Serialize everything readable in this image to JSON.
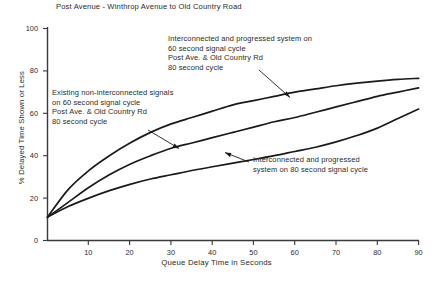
{
  "chart_data": {
    "type": "line",
    "title": "Post Avenue - Winthrop Avenue to Old Country Road",
    "xlabel": "Queue Delay Time in Seconds",
    "ylabel": "% Delayed Time Shown or Less",
    "xlim": [
      0,
      90
    ],
    "ylim": [
      0,
      100
    ],
    "xticks": [
      10,
      20,
      30,
      40,
      50,
      60,
      70,
      80,
      90
    ],
    "yticks": [
      0,
      20,
      40,
      60,
      80,
      100
    ],
    "grid": false,
    "legend": "annotations-with-leader-lines",
    "series": [
      {
        "name": "Interconnected and progressed system on 60 second signal cycle, Post Ave. & Old Country Rd 80 second cycle",
        "x": [
          0,
          5,
          10,
          15,
          20,
          25,
          30,
          35,
          40,
          45,
          50,
          55,
          60,
          65,
          70,
          75,
          80,
          85,
          90
        ],
        "values": [
          11,
          24,
          33,
          40,
          46,
          51,
          55,
          58,
          61,
          64,
          66,
          68,
          70,
          71.5,
          73,
          74.2,
          75.2,
          76,
          76.5
        ]
      },
      {
        "name": "Existing non-interconnected signals on 60 second signal cycle, Post Ave. & Old Country Rd 80 second cycle",
        "x": [
          0,
          5,
          10,
          15,
          20,
          25,
          30,
          35,
          40,
          45,
          50,
          55,
          60,
          65,
          70,
          75,
          80,
          85,
          90
        ],
        "values": [
          11,
          18,
          25,
          31,
          36,
          40,
          43.5,
          46,
          48.5,
          51,
          53.5,
          56,
          58,
          60.5,
          63,
          65.5,
          68,
          70,
          72
        ]
      },
      {
        "name": "Interconnected and progressed system on 80 second signal cycle",
        "x": [
          0,
          5,
          10,
          15,
          20,
          25,
          30,
          35,
          40,
          45,
          50,
          55,
          60,
          65,
          70,
          75,
          80,
          85,
          90
        ],
        "values": [
          11,
          16,
          20,
          23.5,
          26.5,
          29,
          31,
          33,
          34.8,
          36.5,
          38.2,
          40,
          42,
          44,
          46.5,
          49.5,
          53,
          57.5,
          62
        ]
      }
    ],
    "annotations": [
      {
        "id": "interconnected-60",
        "lines": [
          "Interconnected and progressed system on",
          "60 second signal cycle",
          "Post Ave.  & Old Country Rd",
          "80 second cycle"
        ]
      },
      {
        "id": "existing-noninterconnected",
        "lines": [
          "Existing non-interconnected signals",
          "on 60 second signal cycle",
          "Post Ave.  & Old Country Rd",
          "80 second cycle"
        ]
      },
      {
        "id": "interconnected-80",
        "lines": [
          "Interconnected and progressed",
          "system on 80 second signal cycle"
        ]
      }
    ]
  },
  "axis": {
    "x_tick_labels": [
      "10",
      "20",
      "30",
      "40",
      "50",
      "60",
      "70",
      "80",
      "90"
    ],
    "y_tick_labels": [
      "0",
      "20",
      "40",
      "60",
      "80",
      "100"
    ],
    "x_title": "Queue Delay Time in Seconds",
    "y_title": "% Delayed Time Shown or Less"
  },
  "figure": {
    "title": "Post Avenue - Winthrop Avenue to Old Country Road",
    "line_color": "#1a1a1a",
    "axis_color": "#3a3a3a",
    "background": "#ffffff"
  },
  "annotation_text": {
    "a1_l1": "Interconnected and progressed system on",
    "a1_l2": "60 second signal cycle",
    "a1_l3": "Post Ave.  & Old Country Rd",
    "a1_l4": "80 second cycle",
    "a2_l1": "Existing non-interconnected signals",
    "a2_l2": "on 60 second signal cycle",
    "a2_l3": "Post Ave.  & Old Country Rd",
    "a2_l4": "80 second cycle",
    "a3_l1": "Interconnected and progressed",
    "a3_l2": "system on 80 second signal cycle"
  }
}
